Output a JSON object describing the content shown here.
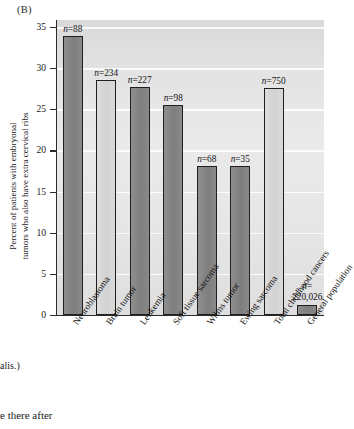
{
  "figure": {
    "panel_label": "(B)",
    "caption_fragment": "alis.)",
    "body_text_fragment": "e there after"
  },
  "chart_data": {
    "type": "bar",
    "title": "",
    "xlabel": "",
    "ylabel": "Percent of patients with embryonal tumors who also have extra cervical ribs",
    "ylabel_line1": "Percent of patients with embryonal",
    "ylabel_line2": "tumors who also have extra cervical ribs",
    "ylim": [
      0,
      35
    ],
    "yticks": [
      0,
      5,
      10,
      15,
      20,
      25,
      30,
      35
    ],
    "ytick_labels": [
      "0",
      "5",
      "10",
      "15",
      "20",
      "25",
      "30",
      "35"
    ],
    "grid": true,
    "legend": "none",
    "categories": [
      "Neuroblastoma",
      "Brain tumor",
      "Leukemia",
      "Soft tissue sarcoma",
      "Wilms tumor",
      "Ewing sarcoma",
      "Total childhood cancers",
      "General population"
    ],
    "values": [
      33.9,
      28.5,
      27.7,
      25.5,
      18.1,
      18.1,
      27.6,
      1.2
    ],
    "annotations": [
      "n=88",
      "n=234",
      "n=227",
      "n=98",
      "n=68",
      "n=35",
      "n=750",
      "n= 220,026"
    ],
    "annotation_values": [
      "88",
      "234",
      "227",
      "98",
      "68",
      "35",
      "750",
      "220,026"
    ],
    "bar_shades": [
      "dark",
      "light",
      "dark",
      "dark",
      "dark",
      "dark",
      "light",
      "dark"
    ],
    "colors": {
      "bar_dark": "#828282",
      "bar_light": "#d7d7d7",
      "bar_outline": "#1f1f1f",
      "plot_background": "#e4e4e4",
      "gridline": "#ffffff",
      "axis": "#2b2b2b",
      "text": "#141414"
    }
  }
}
